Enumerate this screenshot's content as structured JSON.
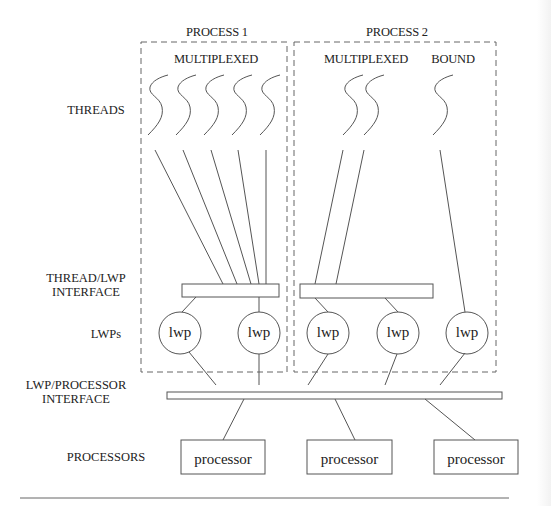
{
  "diagram": {
    "row_labels": {
      "threads": "THREADS",
      "thread_lwp_interface_line1": "THREAD/LWP",
      "thread_lwp_interface_line2": "INTERFACE",
      "lwps": "LWPs",
      "lwp_processor_interface_line1": "LWP/PROCESSOR",
      "lwp_processor_interface_line2": "INTERFACE",
      "processors": "PROCESSORS"
    },
    "processes": [
      {
        "title": "PROCESS 1",
        "groups": [
          {
            "label": "MULTIPLEXED",
            "thread_count": 5
          }
        ],
        "lwps": [
          "lwp",
          "lwp"
        ]
      },
      {
        "title": "PROCESS 2",
        "groups": [
          {
            "label": "MULTIPLEXED",
            "thread_count": 2
          },
          {
            "label": "BOUND",
            "thread_count": 1
          }
        ],
        "lwps": [
          "lwp",
          "lwp",
          "lwp"
        ]
      }
    ],
    "processors": [
      "processor",
      "processor",
      "processor"
    ],
    "colors": {
      "line": "#555555",
      "dash": "#666666",
      "text": "#222222"
    }
  }
}
